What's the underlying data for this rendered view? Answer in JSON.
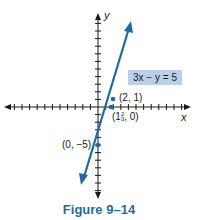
{
  "figure": {
    "caption": "Figure 9–14",
    "equation_label": "3x − y = 5",
    "axes": {
      "x_label": "x",
      "y_label": "y"
    },
    "points": [
      {
        "label": "(2, 1)",
        "x": 2,
        "y": 1
      },
      {
        "label_pre": "(1",
        "label_frac_num": "2",
        "label_frac_den": "3",
        "label_post": ", 0)",
        "x": 1.6667,
        "y": 0
      },
      {
        "label": "(0, −5)",
        "x": 0,
        "y": -5
      }
    ],
    "colors": {
      "line": "#1f6aa5",
      "label_box": "#b9d0e8",
      "caption": "#1f6aa5",
      "axes": "#1a1a1a"
    }
  },
  "chart_data": {
    "type": "line",
    "title": "Figure 9–14",
    "xlabel": "x",
    "ylabel": "y",
    "equation": "3x − y = 5",
    "series": [
      {
        "name": "3x − y = 5",
        "x": [
          -2,
          0,
          1.6667,
          2,
          4.4
        ],
        "y": [
          -11,
          -5,
          0,
          1,
          8.2
        ]
      }
    ],
    "labeled_points": [
      {
        "label": "(2, 1)",
        "x": 2,
        "y": 1
      },
      {
        "label": "(1 2/3, 0)",
        "x": 1.6667,
        "y": 0
      },
      {
        "label": "(0, −5)",
        "x": 0,
        "y": -5
      }
    ],
    "xlim": [
      -13,
      22
    ],
    "ylim": [
      -11,
      12
    ],
    "grid": false,
    "legend": "none"
  }
}
